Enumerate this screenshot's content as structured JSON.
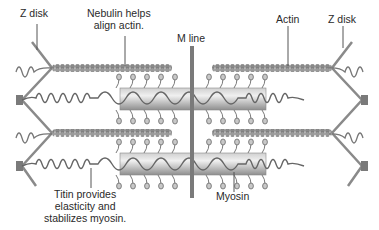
{
  "diagram": {
    "labels": {
      "z_disk_left": "Z disk",
      "nebulin_line1": "Nebulin helps",
      "nebulin_line2": "align actin.",
      "m_line": "M line",
      "actin": "Actin",
      "z_disk_right": "Z disk",
      "titin_line1": "Titin provides",
      "titin_line2": "elasticity and",
      "titin_line3": "stabilizes myosin.",
      "myosin": "Myosin"
    },
    "components": [
      "Z disk",
      "Actin (thin filament)",
      "Nebulin",
      "Titin",
      "Myosin (thick filament)",
      "M line"
    ],
    "colors": {
      "filament": "#8a8a8a",
      "myosin_body_light": "#e4e4e4",
      "myosin_body_dark": "#9a9a9a",
      "line": "#6b6b6b",
      "text": "#2a2a2a"
    }
  }
}
